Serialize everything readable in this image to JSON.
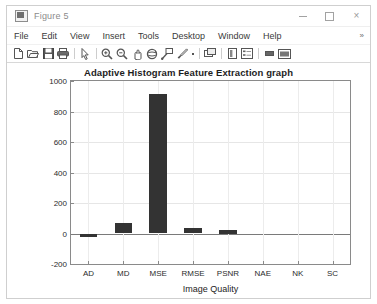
{
  "window": {
    "title": "Figure 5",
    "icon": "matlab-figure-icon",
    "controls": {
      "minimize": "minimize-button",
      "maximize": "maximize-button",
      "close": "×"
    }
  },
  "menubar": {
    "items": [
      "File",
      "Edit",
      "View",
      "Insert",
      "Tools",
      "Desktop",
      "Window",
      "Help"
    ],
    "overflow": "»"
  },
  "toolbar": {
    "buttons": [
      {
        "name": "new-figure-icon",
        "tip": "New Figure"
      },
      {
        "name": "open-file-icon",
        "tip": "Open File"
      },
      {
        "name": "save-figure-icon",
        "tip": "Save Figure"
      },
      {
        "name": "print-figure-icon",
        "tip": "Print Figure"
      },
      {
        "name": "pointer-icon",
        "tip": "Edit Plot"
      },
      {
        "name": "zoom-in-icon",
        "tip": "Zoom In"
      },
      {
        "name": "zoom-out-icon",
        "tip": "Zoom Out"
      },
      {
        "name": "pan-icon",
        "tip": "Pan"
      },
      {
        "name": "rotate-3d-icon",
        "tip": "Rotate 3D"
      },
      {
        "name": "data-cursor-icon",
        "tip": "Data Cursor"
      },
      {
        "name": "brush-icon",
        "tip": "Brush/Select Data"
      },
      {
        "name": "link-plot-icon",
        "tip": "Link Plot"
      },
      {
        "name": "colorbar-icon",
        "tip": "Insert Colorbar"
      },
      {
        "name": "legend-icon",
        "tip": "Insert Legend"
      },
      {
        "name": "hide-plot-tools-icon",
        "tip": "Hide Plot Tools"
      },
      {
        "name": "show-plot-tools-icon",
        "tip": "Show Plot Tools and Dock Figure"
      }
    ]
  },
  "chart_data": {
    "type": "bar",
    "title": "Adaptive Histogram Feature Extraction graph",
    "xlabel": "Image Quality",
    "ylabel": "",
    "categories": [
      "AD",
      "MD",
      "MSE",
      "RMSE",
      "PSNR",
      "NAE",
      "NK",
      "SC"
    ],
    "values": [
      -20,
      68,
      912,
      35,
      25,
      0,
      0,
      0
    ],
    "ylim": [
      -200,
      1000
    ],
    "yticks": [
      -200,
      0,
      200,
      400,
      600,
      800,
      1000
    ],
    "ytick_labels": [
      "-200",
      "0",
      "200",
      "400",
      "600",
      "800",
      "1000"
    ],
    "grid": true,
    "legend": null,
    "bar_color": "#333333",
    "series": [
      {
        "name": "Adaptive Histogram",
        "values": [
          -20,
          68,
          912,
          35,
          25,
          0,
          0,
          0
        ]
      }
    ]
  }
}
